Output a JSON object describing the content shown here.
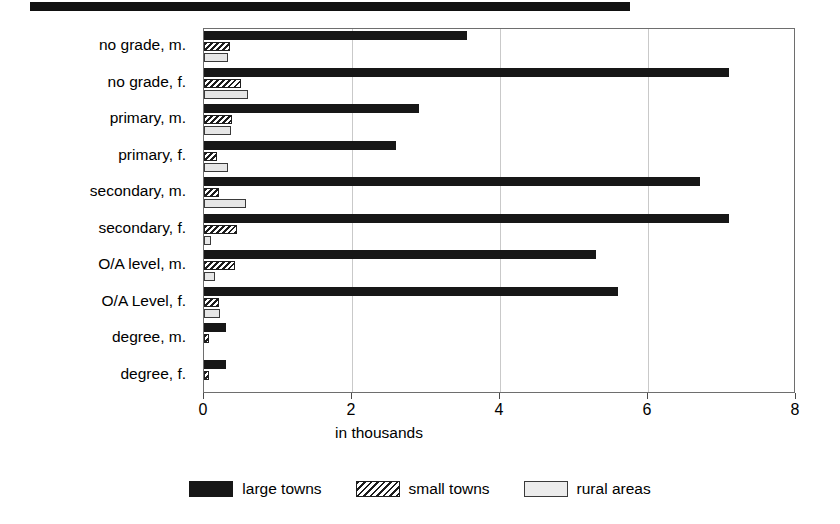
{
  "figure": {
    "top_rule": "decorative-black-rule"
  },
  "chart_data": {
    "type": "bar",
    "orientation": "horizontal",
    "title": "",
    "xlabel": "in thousands",
    "ylabel": "",
    "xlim": [
      0,
      8
    ],
    "xticks": [
      0,
      2,
      4,
      6,
      8
    ],
    "xtick_labels": [
      "0",
      "2",
      "4",
      "6",
      "8"
    ],
    "grid": true,
    "legend_position": "bottom",
    "categories": [
      "no grade, m.",
      "no grade, f.",
      "primary, m.",
      "primary, f.",
      "secondary, m.",
      "secondary, f.",
      "O/A level, m.",
      "O/A Level, f.",
      "degree, m.",
      "degree, f."
    ],
    "series": [
      {
        "name": "large towns",
        "color": "#171717",
        "pattern": "solid",
        "values": [
          3.55,
          7.1,
          2.9,
          2.6,
          6.7,
          7.1,
          5.3,
          5.6,
          0.3,
          0.3
        ]
      },
      {
        "name": "small towns",
        "color": "#1d1d1d",
        "pattern": "diagonal-hatch",
        "values": [
          0.35,
          0.5,
          0.38,
          0.17,
          0.2,
          0.45,
          0.42,
          0.2,
          0.07,
          0.07
        ]
      },
      {
        "name": "rural areas",
        "color": "#e6e6e6",
        "pattern": "light-fill",
        "values": [
          0.33,
          0.6,
          0.37,
          0.32,
          0.57,
          0.1,
          0.15,
          0.22,
          0.0,
          0.0
        ]
      }
    ]
  },
  "legend": {
    "items": [
      {
        "label": "large towns",
        "key": "large"
      },
      {
        "label": "small towns",
        "key": "small"
      },
      {
        "label": "rural areas",
        "key": "rural"
      }
    ]
  }
}
